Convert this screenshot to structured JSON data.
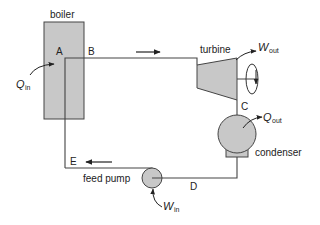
{
  "diagram": {
    "type": "Rankine cycle schematic",
    "components": {
      "boiler": {
        "label": "boiler"
      },
      "turbine": {
        "label": "turbine"
      },
      "condenser": {
        "label": "condenser"
      },
      "feed_pump": {
        "label": "feed pump"
      }
    },
    "state_points": {
      "A": "A",
      "B": "B",
      "C": "C",
      "D": "D",
      "E": "E"
    },
    "energy_flows": {
      "q_in": {
        "symbol": "Q",
        "subscript": "in"
      },
      "w_out": {
        "symbol": "W",
        "subscript": "out"
      },
      "q_out": {
        "symbol": "Q",
        "subscript": "out"
      },
      "w_in": {
        "symbol": "W",
        "subscript": "in"
      }
    },
    "colors": {
      "component_fill": "#c8c8c8",
      "line": "#444444",
      "background": "#ffffff"
    }
  }
}
